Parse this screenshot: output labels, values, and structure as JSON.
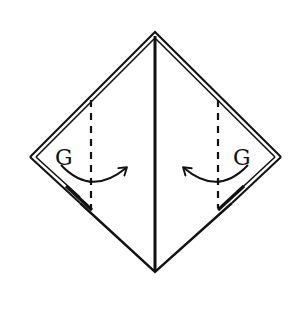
{
  "diagram": {
    "type": "origami-fold-instruction",
    "colors": {
      "background": "#ffffff",
      "line": "#111111"
    },
    "shape": {
      "top": [
        155,
        32
      ],
      "right": [
        283,
        157
      ],
      "bottom": [
        155,
        272
      ],
      "left": [
        28,
        157
      ]
    },
    "labels": {
      "left": "G",
      "right": "G"
    },
    "fold_lines": [
      {
        "side": "left",
        "style": "valley-dashed",
        "x": 91,
        "y1": 100,
        "y2": 208
      },
      {
        "side": "right",
        "style": "valley-dashed",
        "x": 218,
        "y1": 100,
        "y2": 208
      }
    ],
    "arrows": [
      {
        "side": "left",
        "direction": "right",
        "meaning": "fold toward center"
      },
      {
        "side": "right",
        "direction": "left",
        "meaning": "fold toward center"
      }
    ]
  }
}
